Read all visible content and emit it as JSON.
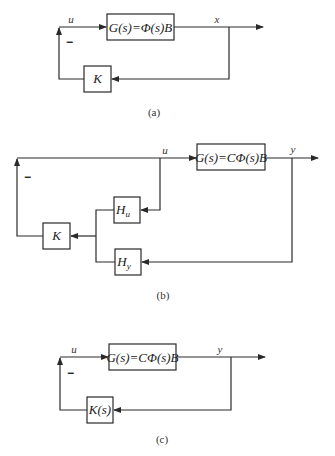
{
  "diagrams": {
    "a": {
      "caption": "(a)",
      "plant_label": "G(s)=Φ(s)B",
      "controller_label": "K",
      "input_signal": "u",
      "output_signal": "x",
      "feedback_sign": "−"
    },
    "b": {
      "caption": "(b)",
      "plant_label": "G(s)=CΦ(s)B",
      "controller_label": "K",
      "filter_u_label": "H",
      "filter_u_sub": "u",
      "filter_y_label": "H",
      "filter_y_sub": "y",
      "input_signal": "u",
      "output_signal": "y",
      "feedback_sign": "−"
    },
    "c": {
      "caption": "(c)",
      "plant_label": "G(s)=CΦ(s)B",
      "controller_label": "K(s)",
      "input_signal": "u",
      "output_signal": "y",
      "feedback_sign": "−"
    }
  },
  "colors": {
    "line": "#2a2a2a",
    "background": "#ffffff"
  }
}
